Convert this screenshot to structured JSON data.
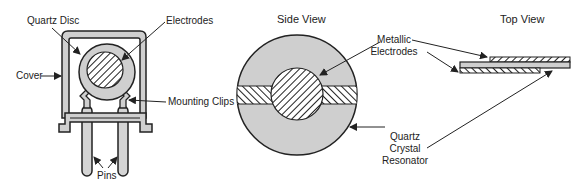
{
  "diagram": {
    "subject": "Quartz crystal resonator",
    "colors": {
      "background": "#ffffff",
      "outline": "#222222",
      "body_fill": "#cfcfcf",
      "pin_fill": "#d4d4d4",
      "hatch": "#222222",
      "text": "#222222"
    },
    "panels": {
      "package": {
        "labels": {
          "quartz_disc": "Quartz Disc",
          "electrodes": "Electrodes",
          "cover": "Cover",
          "mounting_clips": "Mounting Clips",
          "pins": "Pins"
        }
      },
      "side_view": {
        "title": "Side View",
        "labels": {
          "metallic_electrodes_1": "Metallic",
          "metallic_electrodes_2": "Electrodes",
          "quartz_1": "Quartz",
          "quartz_2": "Crystal",
          "quartz_3": "Resonator"
        }
      },
      "top_view": {
        "title": "Top View"
      }
    }
  }
}
